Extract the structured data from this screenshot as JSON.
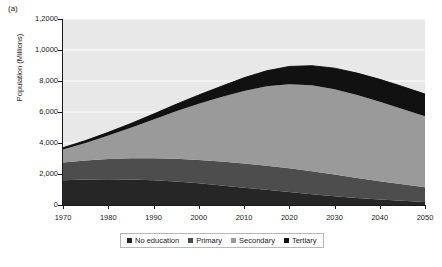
{
  "figure": {
    "panel_label": "(a)",
    "ylabel": "Population (Millions)"
  },
  "legend": {
    "items": [
      {
        "label": "No education",
        "color": "#262626"
      },
      {
        "label": "Primary",
        "color": "#4d4d4d"
      },
      {
        "label": "Secondary",
        "color": "#9a9a9a"
      },
      {
        "label": "Tertiary",
        "color": "#111111"
      }
    ]
  },
  "axes": {
    "y_ticks": [
      {
        "value": 0,
        "label": "0"
      },
      {
        "value": 2000,
        "label": "2,000"
      },
      {
        "value": 4000,
        "label": "4,000"
      },
      {
        "value": 6000,
        "label": "6,000"
      },
      {
        "value": 8000,
        "label": "8,000"
      },
      {
        "value": 10000,
        "label": "1,0000"
      },
      {
        "value": 12000,
        "label": "1,2000"
      }
    ],
    "x_ticks": [
      {
        "value": 1970,
        "label": "1970"
      },
      {
        "value": 1980,
        "label": "1980"
      },
      {
        "value": 1990,
        "label": "1990"
      },
      {
        "value": 2000,
        "label": "2000"
      },
      {
        "value": 2010,
        "label": "2010"
      },
      {
        "value": 2020,
        "label": "2020"
      },
      {
        "value": 2030,
        "label": "2030"
      },
      {
        "value": 2040,
        "label": "2040"
      },
      {
        "value": 2050,
        "label": "2050"
      }
    ]
  },
  "chart_data": {
    "type": "area",
    "stacked": true,
    "title": "",
    "xlabel": "",
    "ylabel": "Population (Millions)",
    "xlim": [
      1970,
      2050
    ],
    "ylim": [
      0,
      12000
    ],
    "grid": true,
    "legend_position": "bottom",
    "x": [
      1970,
      1975,
      1980,
      1985,
      1990,
      1995,
      2000,
      2005,
      2010,
      2015,
      2020,
      2025,
      2030,
      2035,
      2040,
      2045,
      2050
    ],
    "series": [
      {
        "name": "No education",
        "color": "#262626",
        "values": [
          1600,
          1640,
          1660,
          1650,
          1600,
          1520,
          1400,
          1260,
          1120,
          980,
          840,
          700,
          570,
          450,
          350,
          270,
          200
        ]
      },
      {
        "name": "Primary",
        "color": "#4d4d4d",
        "values": [
          1150,
          1230,
          1300,
          1360,
          1420,
          1470,
          1510,
          1540,
          1560,
          1560,
          1530,
          1480,
          1400,
          1300,
          1190,
          1070,
          950
        ]
      },
      {
        "name": "Secondary",
        "color": "#9a9a9a",
        "values": [
          830,
          1130,
          1520,
          1980,
          2500,
          3060,
          3620,
          4160,
          4680,
          5120,
          5420,
          5540,
          5500,
          5340,
          5120,
          4860,
          4580
        ]
      },
      {
        "name": "Tertiary",
        "color": "#111111",
        "values": [
          120,
          160,
          210,
          270,
          350,
          450,
          570,
          700,
          850,
          1000,
          1150,
          1270,
          1360,
          1420,
          1450,
          1450,
          1430
        ]
      }
    ],
    "totals": [
      3700,
      4160,
      4690,
      5260,
      5870,
      6500,
      7100,
      7660,
      8210,
      8660,
      8940,
      8990,
      8830,
      8510,
      8110,
      7650,
      7160
    ]
  }
}
